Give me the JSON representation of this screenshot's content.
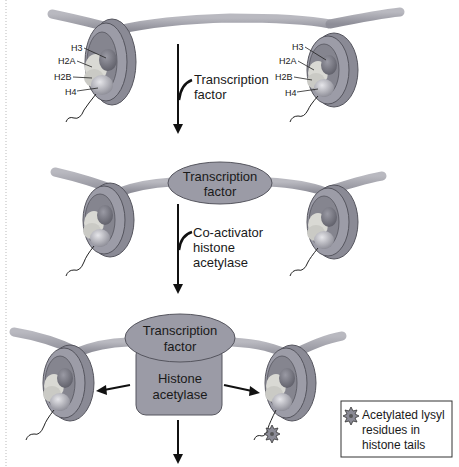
{
  "colors": {
    "dna": "#a3a3ab",
    "dna_dark": "#7d7d88",
    "nucleosome_outer": "#8a8a95",
    "nucleosome_inner": "#a9a9b3",
    "histone_h3": "#6e6e78",
    "histone_h2a": "#d7d7d2",
    "histone_h2b": "#c9c9c4",
    "histone_h4": "#9a9aa4",
    "protein": "#9b9ba6",
    "arrow": "#111111",
    "legend_border": "#333333",
    "background": "#ffffff"
  },
  "stage1": {
    "histone_labels_left": [
      "H3",
      "H2A",
      "H2B",
      "H4"
    ],
    "histone_labels_right": [
      "H3",
      "H2A",
      "H2B",
      "H4"
    ],
    "arrow_label": [
      "Transcription",
      "factor"
    ]
  },
  "stage2": {
    "protein_label": [
      "Transcription",
      "factor"
    ],
    "arrow_label": [
      "Co-activator",
      "histone",
      "acetylase"
    ]
  },
  "stage3": {
    "protein_top_label": [
      "Transcription",
      "factor"
    ],
    "protein_bottom_label": [
      "Histone",
      "acetylase"
    ]
  },
  "legend": {
    "icon": "acetyl-lysine-star-icon",
    "text": [
      "Acetylated lysyl",
      "residues in",
      "histone tails"
    ]
  }
}
